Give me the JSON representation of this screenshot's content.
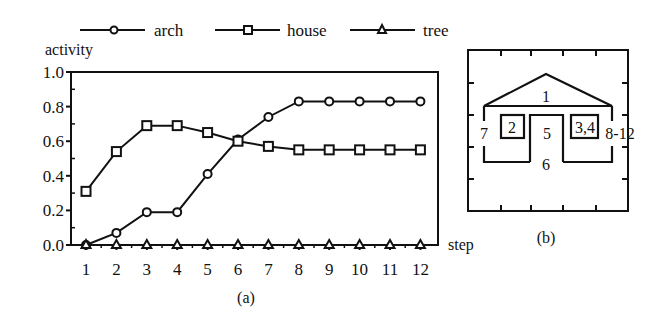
{
  "chart_data": [
    {
      "panel": "(a)",
      "type": "line",
      "title": "",
      "xlabel": "step",
      "ylabel": "activity",
      "x": [
        1,
        2,
        3,
        4,
        5,
        6,
        7,
        8,
        9,
        10,
        11,
        12
      ],
      "xticks": [
        "1",
        "2",
        "3",
        "4",
        "5",
        "6",
        "7",
        "8",
        "9",
        "10",
        "11",
        "12"
      ],
      "yticks": [
        "0.0",
        "0.2",
        "0.4",
        "0.6",
        "0.8",
        "1.0"
      ],
      "ylim": [
        0,
        1.0
      ],
      "xlim": [
        0.5,
        12.5
      ],
      "grid": false,
      "legend_position": "top",
      "series": [
        {
          "name": "arch",
          "marker": "circle",
          "values": [
            0.0,
            0.07,
            0.19,
            0.19,
            0.41,
            0.61,
            0.74,
            0.83,
            0.83,
            0.83,
            0.83,
            0.83
          ]
        },
        {
          "name": "house",
          "marker": "square",
          "values": [
            0.31,
            0.54,
            0.69,
            0.69,
            0.65,
            0.6,
            0.57,
            0.55,
            0.55,
            0.55,
            0.55,
            0.55
          ]
        },
        {
          "name": "tree",
          "marker": "triangle",
          "values": [
            0,
            0,
            0,
            0,
            0,
            0,
            0,
            0,
            0,
            0,
            0,
            0
          ]
        }
      ],
      "caption": "(a)"
    },
    {
      "panel": "(b)",
      "type": "diagram",
      "description": "House drawing with parts numbered by the step at which they are drawn",
      "labels": {
        "roof": "1",
        "left_window": "2",
        "right_window": "3,4",
        "door": "5",
        "base": "6",
        "left_wall": "7",
        "right_wall": "8-12"
      },
      "caption": "(b)"
    }
  ],
  "colors": {
    "ink": "#111111",
    "background": "#ffffff"
  }
}
